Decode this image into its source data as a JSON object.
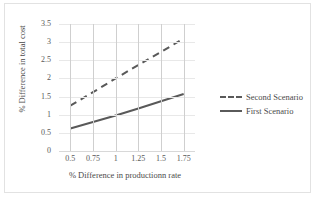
{
  "chart_data": {
    "type": "line",
    "title": "",
    "xlabel": "% Difference in productionn rate",
    "ylabel": "% Difference in total cost",
    "categories": [
      "0.5",
      "0.75",
      "1",
      "1.25",
      "1.5",
      "1.75"
    ],
    "x": [
      0.5,
      0.75,
      1,
      1.25,
      1.5,
      1.75
    ],
    "yticks": [
      "0",
      "0.5",
      "1",
      "1.5",
      "2",
      "2.5",
      "3",
      "3.5"
    ],
    "ylim": [
      0,
      3.5
    ],
    "grid": "horizontal-and-vertical",
    "legend_position": "right",
    "series": [
      {
        "name": "Second Scenario",
        "style": "dashed",
        "color": "#595959",
        "values": [
          1.25,
          1.62,
          2.0,
          2.37,
          2.73,
          3.1
        ]
      },
      {
        "name": "First Scenario",
        "style": "solid",
        "color": "#595959",
        "values": [
          0.62,
          0.8,
          0.98,
          1.17,
          1.37,
          1.57
        ]
      }
    ]
  },
  "legend": {
    "items": [
      {
        "label": "Second Scenario",
        "style": "dashed"
      },
      {
        "label": "First Scenario",
        "style": "solid"
      }
    ]
  },
  "colors": {
    "line": "#595959",
    "grid_horizontal": "#e8e8e8",
    "grid_vertical": "#cfcfcf",
    "frame": "#e2e2e2",
    "text": "#4a4a4a"
  }
}
